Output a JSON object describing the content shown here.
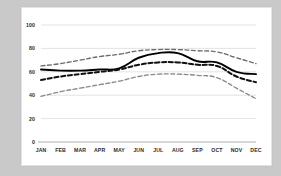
{
  "colors": {
    "page_background": "#c9c9c9",
    "card_background": "#ffffff",
    "card_border": "#e3e3e3",
    "gridline": "#dcdcdc",
    "axis_line": "#b0b0b0",
    "tick_label": "#2b2b2b",
    "mean_line": "#000000",
    "band_upper": "#6b6b6b",
    "band_median_dashed": "#111111",
    "band_lower": "#8a8a8a"
  },
  "chart_data": {
    "type": "line",
    "title": "",
    "subtitle": "",
    "xlabel": "",
    "ylabel": "",
    "categories": [
      "JAN",
      "FEB",
      "MAR",
      "APR",
      "MAY",
      "JUN",
      "JUL",
      "AUG",
      "SEP",
      "OCT",
      "NOV",
      "DEC"
    ],
    "ylim": [
      0,
      100
    ],
    "yticks": [
      0,
      20,
      40,
      60,
      80,
      100
    ],
    "ytick_labels": [
      "0",
      "20",
      "40",
      "60",
      "80",
      "100"
    ],
    "grid": true,
    "grid_axis": "y",
    "legend": false,
    "legend_position": "none",
    "series": [
      {
        "name": "Upper band",
        "style": "dashed",
        "color": "#6b6b6b",
        "values": [
          65,
          67,
          70,
          73,
          75,
          78,
          79,
          79,
          78,
          77,
          72,
          67
        ]
      },
      {
        "name": "Mean",
        "style": "solid",
        "color": "#000000",
        "values": [
          62,
          61,
          61,
          62,
          63,
          72,
          76,
          76,
          69,
          68,
          60,
          58
        ]
      },
      {
        "name": "Median",
        "style": "dashed-thick",
        "color": "#111111",
        "values": [
          53,
          56,
          58,
          60,
          62,
          66,
          68,
          68,
          66,
          65,
          56,
          51
        ]
      },
      {
        "name": "Lower band",
        "style": "dashed",
        "color": "#8a8a8a",
        "values": [
          39,
          43,
          46,
          49,
          52,
          56,
          58,
          58,
          57,
          55,
          46,
          37
        ]
      }
    ]
  }
}
